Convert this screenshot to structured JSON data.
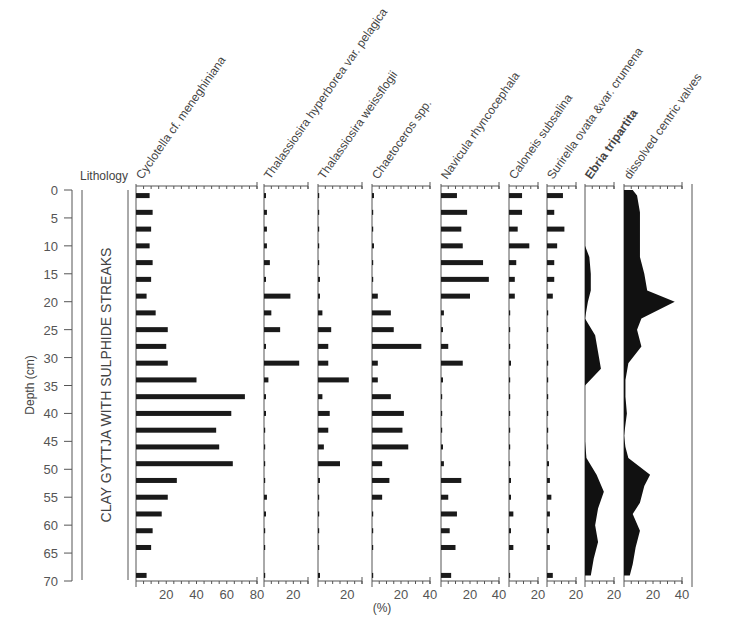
{
  "chart_data": {
    "type": "bar",
    "title": "",
    "ylabel": "Depth (cm)",
    "xlabel": "(%)",
    "ylim": [
      0,
      70
    ],
    "y_ticks": [
      0,
      5,
      10,
      15,
      20,
      25,
      30,
      35,
      40,
      45,
      50,
      55,
      60,
      65,
      70
    ],
    "lithology": {
      "header": "Lithology",
      "text": "CLAY GYTTJA WITH SULPHIDE STREAKS"
    },
    "depths": [
      1,
      4,
      7,
      10,
      13,
      16,
      19,
      22,
      25,
      28,
      31,
      34,
      37,
      40,
      43,
      46,
      49,
      52,
      55,
      58,
      61,
      64,
      69
    ],
    "series": [
      {
        "name": "Cyclotella cf. meneghiniana",
        "style": "bar",
        "xmax": 80,
        "x_ticks": [
          20,
          40,
          60,
          80
        ],
        "values": [
          9,
          11,
          10,
          9,
          11,
          10,
          7,
          13,
          21,
          20,
          21,
          40,
          72,
          63,
          53,
          55,
          64,
          27,
          21,
          17,
          11,
          10,
          7
        ]
      },
      {
        "name": "Thalassiosira hyperborea var. pelagica",
        "style": "bar",
        "xmax": 30,
        "x_ticks": [
          20
        ],
        "values": [
          1,
          2,
          2,
          2,
          4,
          1,
          18,
          5,
          11,
          1,
          24,
          3,
          1,
          1,
          0,
          0,
          0,
          0,
          2,
          1,
          0,
          0,
          0
        ]
      },
      {
        "name": "Thalassiosira weissflogii",
        "style": "bar",
        "xmax": 30,
        "x_ticks": [
          20
        ],
        "values": [
          0,
          0,
          0,
          0,
          0,
          1,
          1,
          3,
          9,
          7,
          7,
          21,
          3,
          8,
          7,
          4,
          15,
          1,
          0,
          0,
          0,
          0,
          1
        ]
      },
      {
        "name": "Chaetoceros spp.",
        "style": "bar",
        "xmax": 40,
        "x_ticks": [
          20,
          40
        ],
        "values": [
          1,
          0,
          0,
          1,
          0,
          0,
          4,
          13,
          15,
          34,
          4,
          4,
          13,
          22,
          21,
          25,
          7,
          12,
          7,
          0,
          0,
          0,
          0
        ]
      },
      {
        "name": "Navicula rhyncocephala",
        "style": "bar",
        "xmax": 40,
        "x_ticks": [
          20,
          40
        ],
        "values": [
          11,
          18,
          14,
          15,
          29,
          33,
          20,
          2,
          1,
          5,
          15,
          1,
          0,
          0,
          0,
          1,
          2,
          14,
          5,
          11,
          6,
          10,
          7
        ]
      },
      {
        "name": "Caloneis subsalina",
        "style": "bar",
        "xmax": 20,
        "x_ticks": [
          20
        ],
        "values": [
          9,
          9,
          6,
          14,
          5,
          4,
          4,
          0,
          0,
          0,
          1,
          0,
          0,
          0,
          0,
          0,
          0,
          1,
          1,
          3,
          1,
          3,
          0
        ]
      },
      {
        "name": "Surirella ovata &var. crumena",
        "style": "bar",
        "xmax": 20,
        "x_ticks": [
          20
        ],
        "values": [
          11,
          5,
          12,
          7,
          5,
          5,
          4,
          0,
          0,
          0,
          0,
          0,
          0,
          0,
          0,
          0,
          1,
          2,
          3,
          2,
          1,
          2,
          4
        ]
      },
      {
        "name": "Ebria tripartita",
        "style": "area",
        "bold": true,
        "xmax": 20,
        "x_ticks": [
          20
        ],
        "depth_points": [
          0,
          10,
          12,
          15,
          18,
          20,
          23,
          26,
          29,
          32,
          35,
          45,
          48,
          51,
          54,
          57,
          60,
          63,
          66,
          69
        ],
        "values": [
          0,
          0,
          3,
          4,
          4,
          2,
          0,
          7,
          9,
          11,
          0,
          0,
          1,
          8,
          13,
          9,
          7,
          9,
          6,
          4
        ]
      },
      {
        "name": "dissolved centric valves",
        "style": "area",
        "xmax": 40,
        "x_ticks": [
          20,
          40
        ],
        "depth_points": [
          0,
          1,
          4,
          9,
          12,
          15,
          18,
          20,
          23,
          25,
          28,
          31,
          34,
          37,
          40,
          42,
          44,
          46,
          48,
          51,
          53,
          56,
          58,
          61,
          64,
          67,
          69
        ],
        "values": [
          6,
          9,
          11,
          11,
          11,
          14,
          16,
          35,
          12,
          9,
          12,
          3,
          1,
          1,
          2,
          1,
          0,
          1,
          3,
          18,
          14,
          11,
          6,
          11,
          8,
          6,
          4
        ]
      }
    ]
  }
}
